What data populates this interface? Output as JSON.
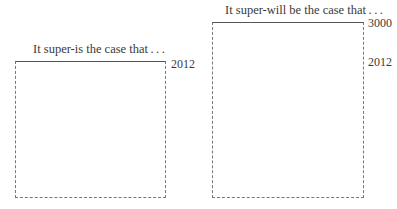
{
  "diagram": {
    "panels": [
      {
        "caption": "It super-is the case that . . .",
        "labels": {
          "top": "2012"
        }
      },
      {
        "caption": "It super-will be the case that . . .",
        "labels": {
          "top": "3000",
          "middle": "2012"
        }
      }
    ]
  }
}
